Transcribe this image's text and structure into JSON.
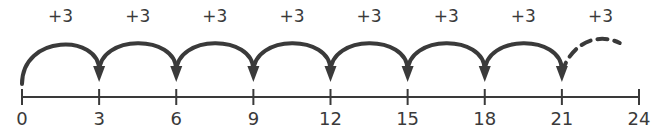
{
  "diagram": {
    "type": "number-line-skip-counting",
    "start": 0,
    "end": 24,
    "step": 3,
    "colors": {
      "ink": "#3a3a3a",
      "background": "#ffffff"
    },
    "ticks": [
      {
        "value": 0,
        "label": "0"
      },
      {
        "value": 3,
        "label": "3"
      },
      {
        "value": 6,
        "label": "6"
      },
      {
        "value": 9,
        "label": "9"
      },
      {
        "value": 12,
        "label": "12"
      },
      {
        "value": 15,
        "label": "15"
      },
      {
        "value": 18,
        "label": "18"
      },
      {
        "value": 21,
        "label": "21"
      },
      {
        "value": 24,
        "label": "24"
      }
    ],
    "jumps": [
      {
        "from": 0,
        "to": 3,
        "label": "+3",
        "style": "solid"
      },
      {
        "from": 3,
        "to": 6,
        "label": "+3",
        "style": "solid"
      },
      {
        "from": 6,
        "to": 9,
        "label": "+3",
        "style": "solid"
      },
      {
        "from": 9,
        "to": 12,
        "label": "+3",
        "style": "solid"
      },
      {
        "from": 12,
        "to": 15,
        "label": "+3",
        "style": "solid"
      },
      {
        "from": 15,
        "to": 18,
        "label": "+3",
        "style": "solid"
      },
      {
        "from": 18,
        "to": 21,
        "label": "+3",
        "style": "solid"
      },
      {
        "from": 21,
        "to": 24,
        "label": "+3",
        "style": "dashed-incomplete"
      }
    ]
  }
}
